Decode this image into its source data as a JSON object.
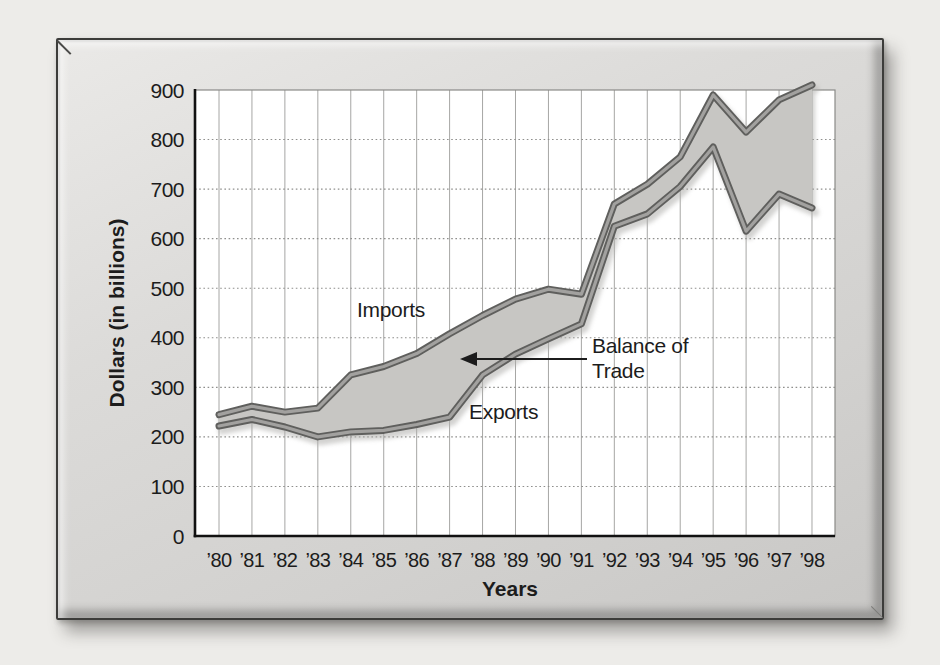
{
  "chart_data": {
    "type": "area",
    "title": "",
    "categories": [
      "’80",
      "’81",
      "’82",
      "’83",
      "’84",
      "’85",
      "’86",
      "’87",
      "’88",
      "’89",
      "’90",
      "’91",
      "’92",
      "’93",
      "’94",
      "’95",
      "’96",
      "’97",
      "’98"
    ],
    "series": [
      {
        "name": "Imports",
        "values": [
          245,
          262,
          250,
          258,
          325,
          342,
          368,
          408,
          445,
          478,
          498,
          488,
          670,
          710,
          765,
          890,
          815,
          880,
          910
        ]
      },
      {
        "name": "Exports",
        "values": [
          222,
          235,
          220,
          200,
          210,
          213,
          225,
          240,
          325,
          367,
          398,
          428,
          625,
          650,
          705,
          785,
          615,
          690,
          662
        ]
      }
    ],
    "xlabel": "Years",
    "ylabel": "Dollars (in billions)",
    "ylim": [
      0,
      900
    ],
    "yticks": [
      0,
      100,
      200,
      300,
      400,
      500,
      600,
      700,
      800,
      900
    ],
    "grid": "on",
    "legend_position": "inline-labels",
    "annotations": [
      {
        "text": "Imports",
        "attached_to": "Imports line"
      },
      {
        "text": "Exports",
        "attached_to": "Exports line"
      },
      {
        "text_line1": "Balance of",
        "text_line2": "Trade",
        "arrow": "points left into shaded gap between lines"
      }
    ]
  },
  "labels": {
    "imports": "Imports",
    "exports": "Exports",
    "balance_line1": "Balance of",
    "balance_line2": "Trade"
  },
  "colors": {
    "page_bg": "#edece9",
    "plot_bg": "#ffffff",
    "band_fill": "#c7c6c3",
    "band_shadow": "#aeadaa",
    "line_outer": "#5f5f5d",
    "line_inner": "#a2a19f",
    "grid_vertical": "#a6a6a4",
    "grid_horizontal": "#8f8f8d",
    "plot_border": "#8a8a88",
    "axis": "#111111",
    "text": "#1c1c1c"
  }
}
